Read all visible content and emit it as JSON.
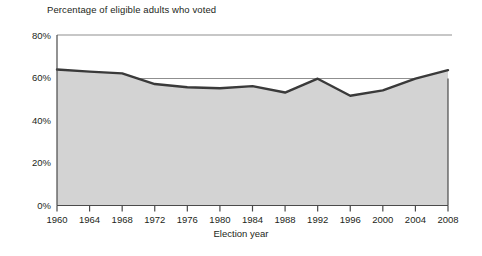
{
  "chart_data": {
    "type": "area",
    "title": "Percentage of eligible adults who voted",
    "xlabel": "Election year",
    "ylabel": "",
    "categories": [
      "1960",
      "1964",
      "1968",
      "1972",
      "1976",
      "1980",
      "1984",
      "1988",
      "1992",
      "1996",
      "2000",
      "2004",
      "2008"
    ],
    "values": [
      63.8,
      62.8,
      62.0,
      57.0,
      55.5,
      55.0,
      56.0,
      53.0,
      59.5,
      51.5,
      54.0,
      59.5,
      63.5
    ],
    "series": [
      {
        "name": "Percentage of eligible adults who voted",
        "values": [
          63.8,
          62.8,
          62.0,
          57.0,
          55.5,
          55.0,
          56.0,
          53.0,
          59.5,
          51.5,
          54.0,
          59.5,
          63.5
        ]
      }
    ],
    "ylim": [
      0,
      80
    ],
    "ytick_labels": [
      "0%",
      "20%",
      "40%",
      "60%",
      "80%"
    ],
    "ytick_values": [
      0,
      20,
      40,
      60,
      80
    ],
    "xtick_labels": [
      "1960",
      "1964",
      "1968",
      "1972",
      "1976",
      "1980",
      "1984",
      "1988",
      "1992",
      "1996",
      "2000",
      "2004",
      "2008"
    ],
    "grid": "horizontal-at-60-and-80",
    "gridlines": [
      60,
      80
    ],
    "legend": "none",
    "colors": {
      "area_fill": "#d3d3d3",
      "line": "#3a3a3a",
      "axis": "#4a4a4a",
      "grid": "#9a9a9a",
      "text": "#231f20",
      "background": "#ffffff"
    }
  }
}
